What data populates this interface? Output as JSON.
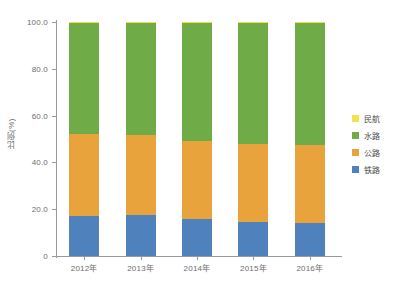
{
  "chart_data": {
    "type": "bar",
    "subtype": "stacked-percentage",
    "title": "",
    "xlabel": "",
    "ylabel": "比例(%)",
    "ylim": [
      0,
      100
    ],
    "yticks": [
      "0",
      "20.0",
      "40.0",
      "60.0",
      "80.0",
      "100.0"
    ],
    "ytick_values": [
      0,
      20,
      40,
      60,
      80,
      100
    ],
    "grid": false,
    "legend_position": "right",
    "categories": [
      "2012年",
      "2013年",
      "2014年",
      "2015年",
      "2016年"
    ],
    "series": [
      {
        "name": "铁路",
        "color": "#4f81bd",
        "values": [
          17.1,
          17.5,
          15.6,
          14.6,
          13.9
        ]
      },
      {
        "name": "公路",
        "color": "#e8a33d",
        "values": [
          35.1,
          34.0,
          33.4,
          33.3,
          33.6
        ]
      },
      {
        "name": "水路",
        "color": "#6fac48",
        "values": [
          47.6,
          48.3,
          50.8,
          51.9,
          52.3
        ]
      },
      {
        "name": "民航",
        "color": "#f2e34c",
        "values": [
          0.2,
          0.2,
          0.2,
          0.2,
          0.2
        ]
      }
    ],
    "stack_order_bottom_to_top": [
      "铁路",
      "公路",
      "水路",
      "民航"
    ],
    "legend_order": [
      "民航",
      "水路",
      "公路",
      "铁路"
    ]
  },
  "colors": {
    "rail": "#4f81bd",
    "highway": "#e8a33d",
    "waterway": "#6fac48",
    "aviation": "#f2e34c",
    "axis": "#9a9a9a",
    "text": "#6d6d6d",
    "background": "#ffffff"
  }
}
